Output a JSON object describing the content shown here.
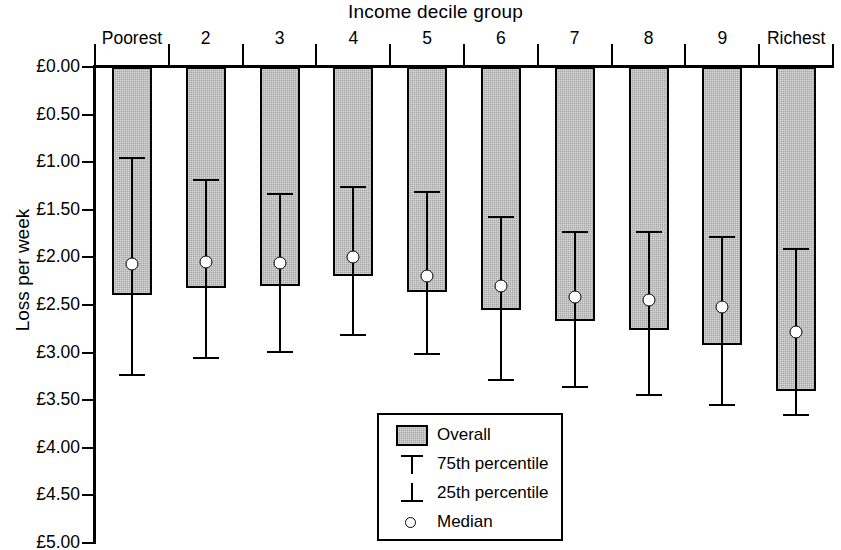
{
  "chart_data": {
    "type": "bar",
    "title": "Income decile group",
    "xlabel": "Income decile group",
    "ylabel": "Loss per week",
    "categories": [
      "Poorest",
      "2",
      "3",
      "4",
      "5",
      "6",
      "7",
      "8",
      "9",
      "Richest"
    ],
    "y_tick_labels": [
      "£0.00",
      "£0.50",
      "£1.00",
      "£1.50",
      "£2.00",
      "£2.50",
      "£3.00",
      "£3.50",
      "£4.00",
      "£4.50",
      "£5.00"
    ],
    "y_tick_values": [
      0,
      0.5,
      1.0,
      1.5,
      2.0,
      2.5,
      3.0,
      3.5,
      4.0,
      4.5,
      5.0
    ],
    "ylim": [
      0,
      5
    ],
    "y_axis_inverted": true,
    "grid": false,
    "legend_position": "inside-bottom-center",
    "series": [
      {
        "name": "Overall",
        "values": [
          2.4,
          2.32,
          2.3,
          2.2,
          2.36,
          2.55,
          2.67,
          2.76,
          2.92,
          3.4
        ]
      },
      {
        "name": "75th percentile",
        "values": [
          0.95,
          1.18,
          1.32,
          1.25,
          1.3,
          1.56,
          1.72,
          1.72,
          1.78,
          1.9
        ]
      },
      {
        "name": "Median",
        "values": [
          2.07,
          2.05,
          2.06,
          2.0,
          2.2,
          2.3,
          2.42,
          2.45,
          2.52,
          2.78
        ]
      },
      {
        "name": "25th percentile",
        "values": [
          3.23,
          3.05,
          2.98,
          2.8,
          3.0,
          3.28,
          3.35,
          3.43,
          3.54,
          3.65
        ]
      }
    ]
  },
  "legend": {
    "entries": [
      {
        "label": "Overall",
        "marker": "swatch"
      },
      {
        "label": "75th percentile",
        "marker": "tee-down"
      },
      {
        "label": "25th percentile",
        "marker": "tee-up"
      },
      {
        "label": "Median",
        "marker": "circle"
      }
    ]
  },
  "colors": {
    "bar_fill": "#a8a8a8",
    "bar_stroke": "#000000",
    "axis": "#000000",
    "median_marker": "#ffffff",
    "background": "#ffffff"
  }
}
